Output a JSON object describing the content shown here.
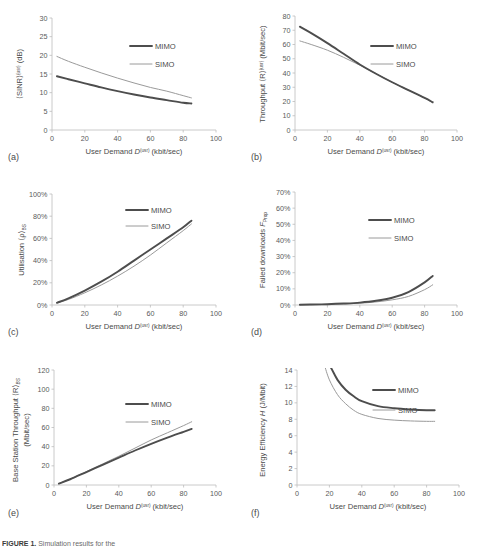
{
  "figure": {
    "caption_bold": "FIGURE 1.",
    "caption_rest": "Simulation results for the",
    "legend": {
      "mimo": "MIMO",
      "simo": "SIMO"
    },
    "xlabel_main": "User Demand ",
    "xlabel_sym": "D",
    "xlabel_sup": "(usr)",
    "xlabel_unit": " (kbit/sec)",
    "xticks": [
      "0",
      "20",
      "40",
      "60",
      "80",
      "100"
    ],
    "xlim": [
      0,
      100
    ]
  },
  "chart_data": [
    {
      "id": "a",
      "panel_label": "(a)",
      "type": "line",
      "title": "",
      "xlabel": "User Demand D^(usr) (kbit/sec)",
      "ylabel": "⟨SINR⟩^(usr) (dB)",
      "ylabel_parts": {
        "pre": "⟨SINR⟩",
        "sup": "(usr)",
        "post": " (dB)"
      },
      "xlim": [
        0,
        100
      ],
      "ylim": [
        0,
        30
      ],
      "xticks": [
        "0",
        "20",
        "40",
        "60",
        "80",
        "100"
      ],
      "yticks": [
        "0",
        "5",
        "10",
        "15",
        "20",
        "25",
        "30"
      ],
      "grid": false,
      "legend_position": "upper-right-inside",
      "x": [
        3,
        10,
        20,
        30,
        40,
        50,
        60,
        70,
        80,
        85
      ],
      "series": [
        {
          "name": "MIMO",
          "values": [
            14.4,
            13.6,
            12.5,
            11.4,
            10.4,
            9.5,
            8.7,
            8.0,
            7.3,
            7.1
          ]
        },
        {
          "name": "SIMO",
          "values": [
            19.7,
            18.4,
            16.8,
            15.3,
            13.9,
            12.6,
            11.4,
            10.4,
            9.2,
            8.6
          ]
        }
      ]
    },
    {
      "id": "b",
      "panel_label": "(b)",
      "type": "line",
      "xlabel": "User Demand D^(usr) (kbit/sec)",
      "ylabel": "Throughput ⟨R⟩^(usr) (Mbit/sec)",
      "ylabel_parts": {
        "pre": "Throughput ⟨R⟩",
        "sup": "(usr)",
        "post": " (Mbit/sec)"
      },
      "xlim": [
        0,
        100
      ],
      "ylim": [
        0,
        80
      ],
      "xticks": [
        "0",
        "20",
        "40",
        "60",
        "80",
        "100"
      ],
      "yticks": [
        "0",
        "10",
        "20",
        "30",
        "40",
        "50",
        "60",
        "70",
        "80"
      ],
      "grid": false,
      "legend_position": "upper-right-inside",
      "x": [
        3,
        10,
        20,
        30,
        40,
        50,
        60,
        70,
        80,
        85
      ],
      "series": [
        {
          "name": "MIMO",
          "values": [
            72.5,
            68.0,
            61.0,
            53.5,
            46.0,
            39.5,
            33.5,
            28.0,
            22.5,
            19.5
          ]
        },
        {
          "name": "SIMO",
          "values": [
            62.5,
            60.0,
            56.0,
            51.0,
            45.5,
            39.5,
            33.5,
            28.0,
            22.5,
            19.0
          ]
        }
      ]
    },
    {
      "id": "c",
      "panel_label": "(c)",
      "type": "line",
      "xlabel": "User Demand D^(usr) (kbit/sec)",
      "ylabel": "Utilisation ⟨ρ⟩BS",
      "ylabel_parts": {
        "pre": "Utilisation ⟨ρ⟩",
        "sub": "BS",
        "post": ""
      },
      "xlim": [
        0,
        100
      ],
      "ylim": [
        0,
        100
      ],
      "xticks": [
        "0",
        "20",
        "40",
        "60",
        "80",
        "100"
      ],
      "yticks": [
        "0%",
        "20%",
        "40%",
        "60%",
        "80%",
        "100%"
      ],
      "grid": false,
      "legend_position": "upper-right-inside",
      "x": [
        3,
        10,
        20,
        30,
        40,
        50,
        60,
        70,
        80,
        85
      ],
      "series": [
        {
          "name": "MIMO",
          "values": [
            2,
            6,
            13,
            21,
            30,
            40,
            50,
            60,
            70,
            76
          ]
        },
        {
          "name": "SIMO",
          "values": [
            2,
            5,
            11,
            18,
            26,
            35,
            45,
            56,
            67,
            73
          ]
        }
      ]
    },
    {
      "id": "d",
      "panel_label": "(d)",
      "type": "line",
      "xlabel": "User Demand D^(usr) (kbit/sec)",
      "ylabel": "Failed downloads FProp",
      "ylabel_parts": {
        "pre": "Failed downloads ",
        "ital": "F",
        "sub": "Prop",
        "post": ""
      },
      "xlim": [
        0,
        100
      ],
      "ylim": [
        0,
        70
      ],
      "xticks": [
        "0",
        "20",
        "40",
        "60",
        "80",
        "100"
      ],
      "yticks": [
        "0%",
        "10%",
        "20%",
        "30%",
        "40%",
        "50%",
        "60%",
        "70%"
      ],
      "grid": false,
      "legend_position": "upper-right-inside",
      "x": [
        3,
        10,
        20,
        30,
        40,
        50,
        60,
        70,
        80,
        85
      ],
      "series": [
        {
          "name": "MIMO",
          "values": [
            0.2,
            0.3,
            0.5,
            0.9,
            1.5,
            2.6,
            4.5,
            8.0,
            14.0,
            18.0
          ]
        },
        {
          "name": "SIMO",
          "values": [
            0.2,
            0.25,
            0.4,
            0.7,
            1.1,
            1.9,
            3.2,
            5.3,
            9.5,
            12.5
          ]
        }
      ]
    },
    {
      "id": "e",
      "panel_label": "(e)",
      "type": "line",
      "xlabel": "User Demand D^(usr) (kbit/sec)",
      "ylabel": "Base Station Throughput ⟨R⟩BS (Mbit/sec)",
      "ylabel_parts": {
        "pre": "Base Station Throughput ⟨R⟩",
        "sub": "BS",
        "line2": "(Mbit/sec)"
      },
      "xlim": [
        0,
        100
      ],
      "ylim": [
        0,
        120
      ],
      "xticks": [
        "0",
        "20",
        "40",
        "60",
        "80",
        "100"
      ],
      "yticks": [
        "0",
        "20",
        "40",
        "60",
        "80",
        "100",
        "120"
      ],
      "grid": false,
      "legend_position": "upper-right-inside",
      "x": [
        3,
        10,
        20,
        30,
        40,
        50,
        60,
        70,
        80,
        85
      ],
      "series": [
        {
          "name": "MIMO",
          "values": [
            1.5,
            6.0,
            13.5,
            21.0,
            28.5,
            36.0,
            43.0,
            49.5,
            55.5,
            58.5
          ]
        },
        {
          "name": "SIMO",
          "values": [
            1.5,
            6.2,
            14.0,
            22.0,
            30.0,
            38.5,
            47.0,
            54.5,
            62.0,
            66.0
          ]
        }
      ]
    },
    {
      "id": "f",
      "panel_label": "(f)",
      "type": "line",
      "xlabel": "User Demand D^(usr) (kbit/sec)",
      "ylabel": "Energy Efficiency H (J/Mbit)",
      "ylabel_parts": {
        "pre": "Energy Efficiency ",
        "ital": "H",
        "post": " (J/Mbit)"
      },
      "xlim": [
        0,
        100
      ],
      "ylim": [
        0,
        14
      ],
      "xticks": [
        "0",
        "20",
        "40",
        "60",
        "80",
        "100"
      ],
      "yticks": [
        "0",
        "2",
        "4",
        "6",
        "8",
        "10",
        "12",
        "14"
      ],
      "grid": false,
      "legend_position": "upper-right-inside",
      "x": [
        17,
        20,
        25,
        30,
        35,
        40,
        50,
        60,
        70,
        80,
        85
      ],
      "series": [
        {
          "name": "MIMO",
          "values": [
            15.2,
            14.4,
            12.8,
            11.6,
            10.8,
            10.2,
            9.6,
            9.35,
            9.2,
            9.1,
            9.1
          ]
        },
        {
          "name": "SIMO",
          "values": [
            14.8,
            12.8,
            11.0,
            9.9,
            9.1,
            8.6,
            8.1,
            7.9,
            7.8,
            7.75,
            7.75
          ]
        }
      ]
    }
  ]
}
